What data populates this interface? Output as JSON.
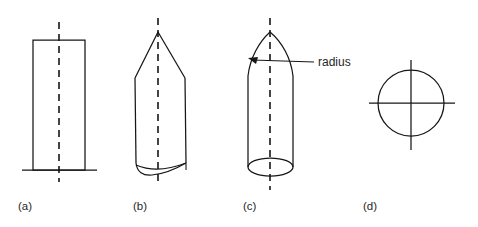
{
  "diagram": {
    "background_color": "#ffffff",
    "line_color": "#161616",
    "text_color": "#262626",
    "annotations": [
      {
        "id": "radius",
        "label": "radius",
        "x": 318,
        "y": 66,
        "leader_from": [
          314,
          62
        ],
        "leader_to": [
          252,
          60
        ],
        "arrow_at": [
          250,
          59
        ]
      }
    ],
    "figures": [
      {
        "key": "a",
        "caption": "(a)",
        "caption_x": 18,
        "caption_y": 210,
        "shape": "flat-nose-cylinder",
        "centerline_x": 59,
        "centerline_top": 22,
        "centerline_bottom": 182,
        "body_left": 33,
        "body_right": 85,
        "body_top": 40,
        "body_bottom": 170,
        "base_line_left": 22,
        "base_line_right": 97,
        "base_line_y": 170
      },
      {
        "key": "b",
        "caption": "(b)",
        "caption_x": 133,
        "caption_y": 210,
        "shape": "conical-nose",
        "centerline_x": 158,
        "centerline_top": 18,
        "centerline_bottom": 186,
        "apex_x": 158,
        "apex_y": 32,
        "shoulder_left_x": 135,
        "shoulder_right_x": 185,
        "shoulder_y": 78,
        "body_left": 136,
        "body_right": 186,
        "body_bottom": 172
      },
      {
        "key": "c",
        "caption": "(c)",
        "caption_x": 243,
        "caption_y": 210,
        "shape": "ogive-nose-cylinder",
        "centerline_x": 270,
        "centerline_top": 18,
        "centerline_bottom": 190,
        "apex_x": 270,
        "apex_y": 32,
        "body_left": 248,
        "body_right": 293,
        "shoulder_y": 76,
        "base_ellipse_cy": 167,
        "base_ellipse_rx": 22.5,
        "base_ellipse_ry": 9
      },
      {
        "key": "d",
        "caption": "(d)",
        "caption_x": 363,
        "caption_y": 210,
        "shape": "circle-with-crosshair",
        "circle_cx": 411,
        "circle_cy": 103,
        "circle_r": 33,
        "crosshair_h_left": 369,
        "crosshair_h_right": 455,
        "crosshair_v_top": 60,
        "crosshair_v_bottom": 150
      }
    ]
  }
}
